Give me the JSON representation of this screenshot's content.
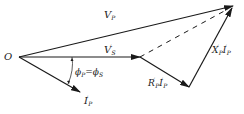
{
  "diagram": {
    "type": "phasor diagram",
    "origin_label": "O",
    "vectors": [
      {
        "id": "Vp",
        "label": "V",
        "sub": "P",
        "sup": ""
      },
      {
        "id": "Vs",
        "label": "V",
        "sub": "S",
        "sup": "′"
      },
      {
        "id": "Ip",
        "label": "I",
        "sub": "P",
        "sup": "′"
      },
      {
        "id": "RI",
        "label": "R",
        "sub": "P",
        "sup": "′",
        "label2": "I",
        "sub2": "P",
        "sup2": "′"
      },
      {
        "id": "XI",
        "label": "X",
        "sub": "P",
        "sup": "′",
        "label2": "I",
        "sub2": "P",
        "sup2": "′"
      }
    ],
    "angle_label": {
      "left": "ϕ",
      "left_sub": "P",
      "eq": "=",
      "right": "ϕ",
      "right_sub": "S"
    },
    "line_color": "#1a1a1a"
  }
}
